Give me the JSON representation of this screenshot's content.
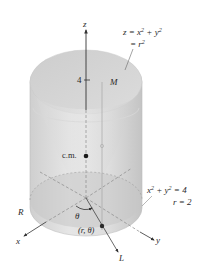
{
  "figure": {
    "type": "3d-solid-diagram",
    "colors": {
      "background": "#ffffff",
      "cylinder_fill_light": "#e4e4e4",
      "cylinder_fill_dark": "#c2c2c2",
      "paraboloid_fill": "#d2d2d2",
      "axis_stroke": "#444444",
      "dashed_stroke": "#8a8a8a",
      "point": "#1a1a1a",
      "text": "#2a2a2a"
    },
    "axes": {
      "z_label": "z",
      "x_label": "x",
      "y_label": "y",
      "z_tick_label": "4"
    },
    "labels": {
      "paraboloid_eq_line1_left": "z = x",
      "paraboloid_eq_line1_exp1": "2",
      "paraboloid_eq_line1_mid": " + y",
      "paraboloid_eq_line1_exp2": "2",
      "paraboloid_eq_line2_left": "= r",
      "paraboloid_eq_line2_exp": "2",
      "M_label": "M",
      "cm_label": "c.m.",
      "cylinder_eq_line1_left": "x",
      "cylinder_eq_line1_exp1": "2",
      "cylinder_eq_line1_mid": " + y",
      "cylinder_eq_line1_exp2": "2",
      "cylinder_eq_line1_right": " = 4",
      "cylinder_eq_line2": "r = 2",
      "region_label": "R",
      "theta_label": "θ",
      "point_label": "(r, θ)",
      "line_label": "L"
    }
  }
}
